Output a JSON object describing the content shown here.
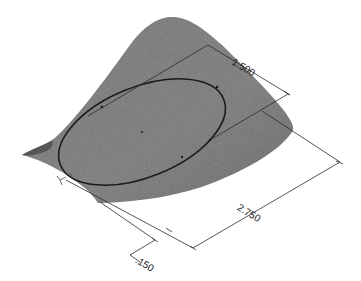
{
  "figure": {
    "colors": {
      "background": "#ffffff",
      "surface": "#8c8c8c",
      "surface_dark": "#6e6e6e",
      "line": "#1a1a1a",
      "dim_line": "#3a3a3a"
    },
    "dimensions": [
      {
        "id": "minor-axis",
        "label": "1.500"
      },
      {
        "id": "major-axis",
        "label": "2.750"
      },
      {
        "id": "offset",
        "label": ".150"
      }
    ]
  }
}
